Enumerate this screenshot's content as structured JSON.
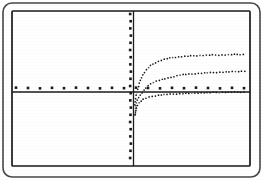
{
  "figure": {
    "caption": "",
    "background_color": "#ffffff",
    "ink_color": "#1a1a1a",
    "faint_ink_color": "#5a5a5a"
  },
  "frames": {
    "outer_frame": {
      "name": "outer-rounded-frame",
      "x": 3,
      "y": 3,
      "width": 257,
      "height": 174,
      "corner_radius": 9,
      "stroke_width": 1.6,
      "color": "#262626"
    },
    "inner_frame": {
      "name": "inner-plot-border",
      "x": 12,
      "y": 11,
      "width": 238,
      "height": 155,
      "corner_radius": 1,
      "stroke_width": 1.7,
      "color": "#1a1a1a"
    }
  },
  "chart_data": {
    "type": "line",
    "title": "",
    "subtitle": "",
    "xlabel": "",
    "ylabel": "",
    "grid": false,
    "legend_position": "none",
    "axis_style": "solid-line-with-dotted-square-markers",
    "curve_style": "dotted",
    "xlim": [
      -11.0,
      10.0
    ],
    "ylim": [
      -5.6,
      5.0
    ],
    "origin_pixel": {
      "x": 133.5,
      "y": 92.0
    },
    "pixels_per_x_unit": 11.33,
    "pixels_per_y_unit": 14.5,
    "axes": {
      "x_axis": {
        "name": "x-axis",
        "y_pixel": 92,
        "x_start_pixel": 12,
        "x_end_pixel": 250,
        "marker_count": 21,
        "marker_spacing_px": 12,
        "marker_offset_y_px": -4,
        "marker_size_px": 2.6
      },
      "y_axis": {
        "name": "y-axis",
        "x_pixel": 133.5,
        "y_start_pixel": 11,
        "y_end_pixel": 166,
        "marker_count": 22,
        "marker_spacing_px": 7.2,
        "marker_offset_x_px": -3,
        "marker_size_px": 2.6
      }
    },
    "series": [
      {
        "name": "upper-log-curve",
        "label": "",
        "style": "dotted",
        "dot_radius_px": 0.85,
        "dot_spacing_px": 2.6,
        "x": [
          0.05,
          0.2,
          0.4,
          0.7,
          1.0,
          1.5,
          2.0,
          2.6,
          3.3,
          4.0,
          5.0,
          6.0,
          7.0,
          8.0,
          9.0,
          10.0
        ],
        "y": [
          -0.9,
          0.25,
          0.85,
          1.3,
          1.55,
          1.85,
          2.05,
          2.2,
          2.32,
          2.4,
          2.5,
          2.56,
          2.6,
          2.63,
          2.65,
          2.66
        ],
        "pixel_points": [
          [
            135,
            105
          ],
          [
            136,
            96
          ],
          [
            138,
            88
          ],
          [
            141,
            79
          ],
          [
            144,
            73
          ],
          [
            149,
            67
          ],
          [
            155,
            63
          ],
          [
            162,
            60
          ],
          [
            170,
            58
          ],
          [
            178,
            57
          ],
          [
            190,
            56
          ],
          [
            200,
            55.5
          ],
          [
            211,
            55
          ],
          [
            222,
            55
          ],
          [
            233,
            54.5
          ],
          [
            245,
            54.5
          ]
        ]
      },
      {
        "name": "middle-log-curve",
        "label": "",
        "style": "dotted",
        "dot_radius_px": 0.85,
        "dot_spacing_px": 2.6,
        "x": [
          0.05,
          0.3,
          0.6,
          1.0,
          1.5,
          2.2,
          3.0,
          4.0,
          5.0,
          6.0,
          7.0,
          8.0,
          9.0,
          10.0
        ],
        "y": [
          -1.6,
          -0.6,
          -0.1,
          0.3,
          0.6,
          0.85,
          1.0,
          1.15,
          1.25,
          1.3,
          1.35,
          1.38,
          1.4,
          1.41
        ],
        "pixel_points": [
          [
            135,
            115
          ],
          [
            137,
            101
          ],
          [
            141,
            94
          ],
          [
            146,
            88
          ],
          [
            152,
            83
          ],
          [
            160,
            80
          ],
          [
            169,
            78
          ],
          [
            180,
            75
          ],
          [
            192,
            74
          ],
          [
            203,
            73
          ],
          [
            215,
            72.5
          ],
          [
            226,
            72
          ],
          [
            237,
            71.5
          ],
          [
            247,
            71
          ]
        ]
      },
      {
        "name": "lower-log-curve",
        "label": "",
        "style": "dotted",
        "dot_radius_px": 0.85,
        "dot_spacing_px": 2.6,
        "x": [
          0.05,
          0.25,
          0.5,
          0.9,
          1.4,
          2.0,
          2.8,
          3.6,
          4.6,
          5.6,
          6.8,
          8.0,
          9.2,
          10.0
        ],
        "y": [
          -1.5,
          -0.95,
          -0.68,
          -0.48,
          -0.34,
          -0.25,
          -0.18,
          -0.13,
          -0.09,
          -0.06,
          -0.04,
          -0.02,
          -0.01,
          0.0
        ],
        "pixel_points": [
          [
            135.5,
            114
          ],
          [
            137,
            106
          ],
          [
            140,
            102
          ],
          [
            144,
            99
          ],
          [
            150,
            97
          ],
          [
            157,
            95.5
          ],
          [
            165,
            94.5
          ],
          [
            175,
            94
          ],
          [
            186,
            93.4
          ],
          [
            198,
            93
          ],
          [
            211,
            92.6
          ],
          [
            223,
            92.3
          ],
          [
            236,
            92.1
          ],
          [
            246,
            92
          ]
        ]
      }
    ],
    "annotations": []
  }
}
